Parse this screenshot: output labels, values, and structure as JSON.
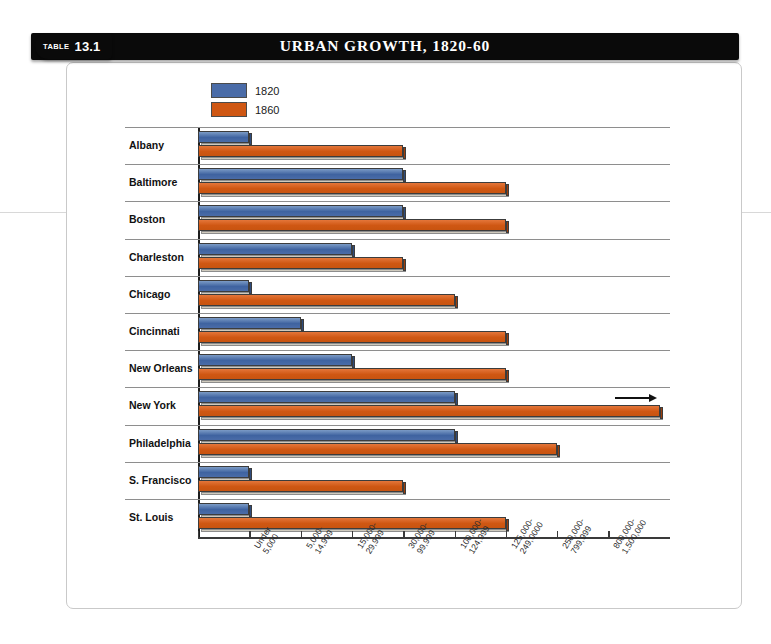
{
  "badge": {
    "kicker": "TABLE",
    "number": "13.1"
  },
  "header": {
    "title": "URBAN GROWTH, 1820-60"
  },
  "chart_data": {
    "type": "bar",
    "orientation": "horizontal",
    "title": "URBAN GROWTH, 1820-60",
    "xlabel": "",
    "ylabel": "",
    "grid": false,
    "legend_position": "top-left",
    "legend": [
      {
        "name": "1820",
        "color": "#4a6ca8"
      },
      {
        "name": "1860",
        "color": "#cf5713"
      }
    ],
    "x_tick_labels": [
      "Under\n5,000",
      "5,000-\n14,999",
      "15,000-\n29,999",
      "30,000-\n99,999",
      "100,000-\n124,999",
      "125,000-\n249,0000",
      "250,000-\n799,999",
      "800,000-\n1,500,000"
    ],
    "categories": [
      "Albany",
      "Baltimore",
      "Boston",
      "Charleston",
      "Chicago",
      "Cincinnati",
      "New Orleans",
      "New York",
      "Philadelphia",
      "S. Francisco",
      "St. Louis"
    ],
    "series": [
      {
        "name": "1820",
        "color": "#4a6ca8",
        "values": [
          1,
          4,
          4,
          3,
          1,
          2,
          3,
          5,
          5,
          1,
          1
        ],
        "value_labels": [
          "5,000-14,999",
          "30,000-99,999",
          "30,000-99,999",
          "15,000-29,999",
          "5,000-14,999",
          "15,000-29,999",
          "15,000-29,999",
          "100,000-124,999",
          "100,000-124,999",
          "5,000-14,999",
          "5,000-14,999"
        ]
      },
      {
        "name": "1860",
        "color": "#cf5713",
        "values": [
          4,
          6,
          6,
          4,
          5,
          6,
          6,
          9,
          7,
          4,
          6
        ],
        "value_labels": [
          "30,000-99,999",
          "125,000-249,0000",
          "125,000-249,0000",
          "30,000-99,999",
          "100,000-124,999",
          "125,000-249,0000",
          "125,000-249,0000",
          "800,000-1,500,000",
          "250,000-799,999",
          "30,000-99,999",
          "125,000-249,0000"
        ]
      }
    ],
    "annotations": [
      {
        "type": "overflow-arrow",
        "category": "New York",
        "series": "1860",
        "note": "bar extends past final tick"
      }
    ]
  }
}
